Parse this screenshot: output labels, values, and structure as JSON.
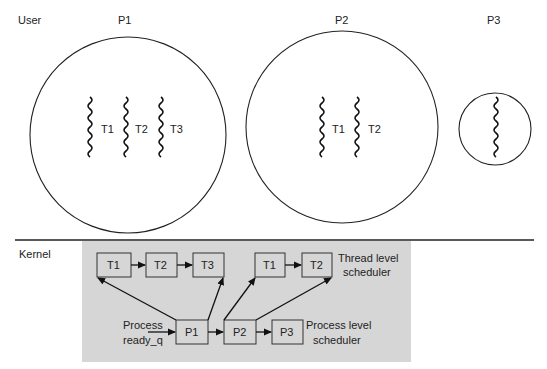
{
  "regions": {
    "user_label": "User",
    "kernel_label": "Kernel"
  },
  "processes": [
    {
      "id": "P1",
      "label": "P1",
      "threads": [
        "T1",
        "T2",
        "T3"
      ]
    },
    {
      "id": "P2",
      "label": "P2",
      "threads": [
        "T1",
        "T2"
      ]
    },
    {
      "id": "P3",
      "label": "P3",
      "threads": [
        ""
      ]
    }
  ],
  "kernel": {
    "thread_queue_p1": [
      "T1",
      "T2",
      "T3"
    ],
    "thread_queue_p2": [
      "T1",
      "T2"
    ],
    "process_queue": [
      "P1",
      "P2",
      "P3"
    ],
    "ready_q_label_line1": "Process",
    "ready_q_label_line2": "ready_q",
    "thread_scheduler_line1": "Thread level",
    "thread_scheduler_line2": "scheduler",
    "process_scheduler_line1": "Process level",
    "process_scheduler_line2": "scheduler"
  },
  "colors": {
    "kernel_bg": "#d6d6d6",
    "stroke": "#222222"
  }
}
